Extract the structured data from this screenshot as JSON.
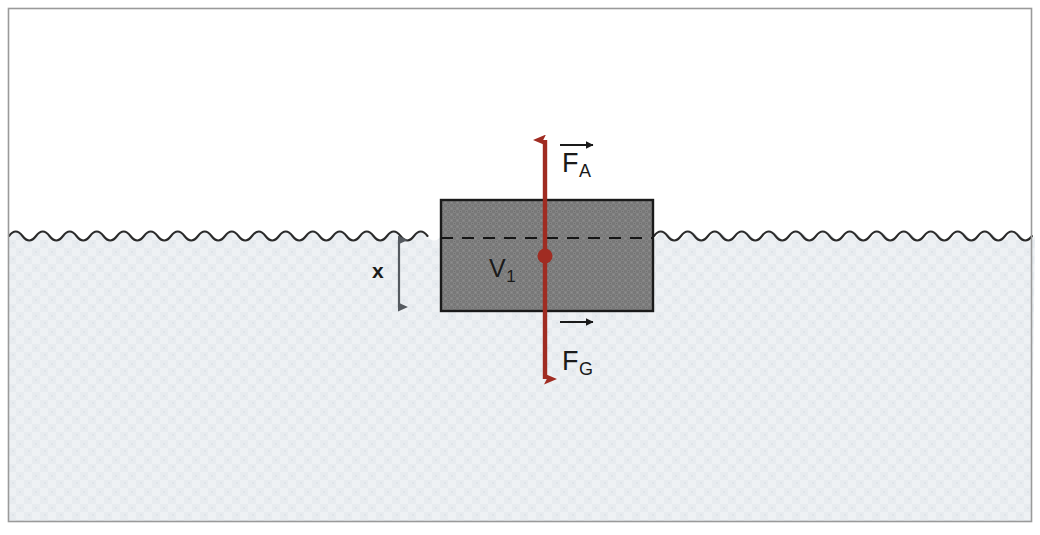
{
  "figure": {
    "width": 1040,
    "height": 535
  },
  "colors": {
    "frame_border": "#9a9a9a",
    "page_background": "#ffffff",
    "water_fill": "#e6eaee",
    "water_surface_line": "#2b2b2b",
    "block_fill": "#808080",
    "block_border": "#1a1a1a",
    "waterline_dash": "#151515",
    "force_vector": "#a02c22",
    "center_dot": "#a02c22",
    "dimension_arrow": "#555a60",
    "label_text": "#1a1a1a"
  },
  "labels": {
    "buoyant_force": {
      "symbol": "F",
      "subscript": "A",
      "vector_arrow": "over-arrow",
      "name": "buoyant-force-label"
    },
    "gravity_force": {
      "symbol": "F",
      "subscript": "G",
      "vector_arrow": "over-arrow",
      "name": "gravity-force-label"
    },
    "submerged_volume": {
      "symbol": "V",
      "subscript": "1",
      "name": "submerged-volume-label"
    },
    "depth": {
      "symbol": "x",
      "name": "submersion-depth-label"
    }
  },
  "geometry": {
    "frame": {
      "x": 8,
      "y": 8,
      "width": 1024,
      "height": 514
    },
    "water": {
      "surface_y": 236,
      "bottom_y": 521,
      "left_x": 9,
      "right_x": 1031
    },
    "wave": {
      "period": 27,
      "amplitude": 7
    },
    "block": {
      "x": 441,
      "y": 200,
      "width": 212,
      "height": 111
    },
    "waterline_dash": {
      "y": 238,
      "x1": 441,
      "x2": 653
    },
    "force_line": {
      "x": 545,
      "top_y": 138,
      "bottom_y": 381
    },
    "center_dot": {
      "cx": 545,
      "cy": 256,
      "r": 7
    },
    "dimension_arrow": {
      "x": 399,
      "top_y": 236,
      "bottom_y": 311
    },
    "vector_arrow_FA": {
      "x1": 560,
      "x2": 596,
      "y": 145
    },
    "vector_arrow_FG": {
      "x1": 560,
      "x2": 596,
      "y": 322
    }
  }
}
